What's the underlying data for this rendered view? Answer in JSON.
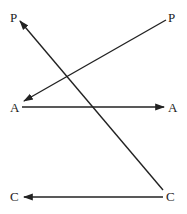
{
  "diagram": {
    "type": "arrow-mapping",
    "labels": {
      "p_left": "P",
      "p_right": "P",
      "a_left": "A",
      "a_right": "A",
      "c_left": "C",
      "c_right": "C"
    },
    "arrows": [
      {
        "from": "C (right)",
        "to": "P (left)",
        "direction": "up-left"
      },
      {
        "from": "P (right)",
        "to": "A (left)",
        "direction": "down-left"
      },
      {
        "from": "A (left)",
        "to": "A (right)",
        "direction": "right"
      },
      {
        "from": "C (right)",
        "to": "C (left)",
        "direction": "left"
      }
    ],
    "line_color": "#222222",
    "background": "#ffffff"
  }
}
